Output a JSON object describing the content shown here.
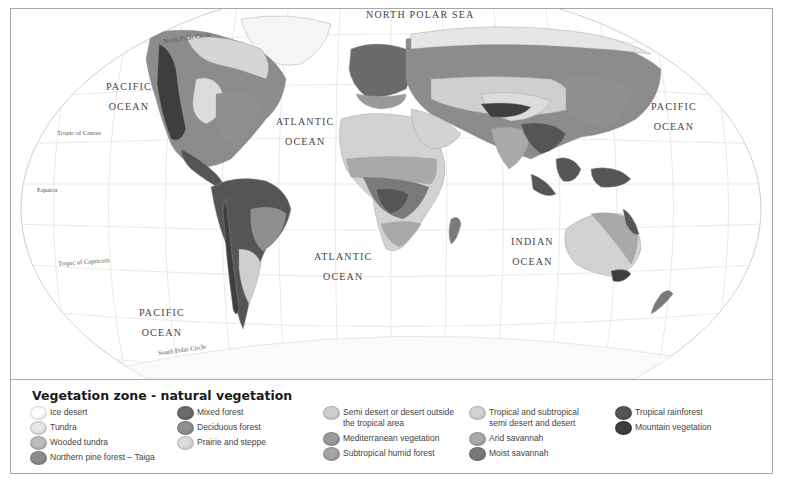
{
  "map": {
    "title": "Vegetation zone - natural vegetation",
    "oceans": [
      {
        "id": "north-polar-sea",
        "line1": "NORTH POLAR SEA",
        "line2": ""
      },
      {
        "id": "pacific-ocean-nw",
        "line1": "PACIFIC",
        "line2": "OCEAN"
      },
      {
        "id": "atlantic-ocean-north",
        "line1": "ATLANTIC",
        "line2": "OCEAN"
      },
      {
        "id": "pacific-ocean-ne",
        "line1": "PACIFIC",
        "line2": "OCEAN"
      },
      {
        "id": "atlantic-ocean-south",
        "line1": "ATLANTIC",
        "line2": "OCEAN"
      },
      {
        "id": "indian-ocean",
        "line1": "INDIAN",
        "line2": "OCEAN"
      },
      {
        "id": "pacific-ocean-sw",
        "line1": "PACIFIC",
        "line2": "OCEAN"
      }
    ],
    "lines": {
      "north_polar_circle": "North Polar Circle",
      "tropic_of_cancer": "Tropic of Cancer",
      "equator": "Equator",
      "tropic_of_capricorn": "Tropic of Capricorn",
      "south_polar_circle": "South Polar Circle"
    }
  },
  "legend": {
    "title": "Vegetation zone - natural vegetation",
    "columns": [
      [
        {
          "label": "Ice desert",
          "color": "#ffffff"
        },
        {
          "label": "Tundra",
          "color": "#e6e6e6"
        },
        {
          "label": "Wooded tundra",
          "color": "#bdbdbd"
        },
        {
          "label": "Northern pine forest – Taiga",
          "color": "#8c8c8c"
        }
      ],
      [
        {
          "label": "Mixed forest",
          "color": "#6a6a6a"
        },
        {
          "label": "Deciduous forest",
          "color": "#8f8f8f"
        },
        {
          "label": "Prairie and steppe",
          "color": "#dcdcdc"
        }
      ],
      [
        {
          "label": "Semi desert or desert outside the tropical area",
          "color": "#cfcfcf"
        },
        {
          "label": "Mediterranean vegetation",
          "color": "#9a9a9a"
        },
        {
          "label": "Subtropical humid forest",
          "color": "#a4a4a4"
        }
      ],
      [
        {
          "label": "Tropical and subtropical semi desert and desert",
          "color": "#d2d2d2"
        },
        {
          "label": "Arid savannah",
          "color": "#a9a9a9"
        },
        {
          "label": "Moist savannah",
          "color": "#7a7a7a"
        }
      ],
      [
        {
          "label": "Tropical rainforest",
          "color": "#555555"
        },
        {
          "label": "Mountain vegetation",
          "color": "#3e3e3e"
        }
      ]
    ]
  },
  "colors": {
    "frame_border": "#a8a8a8",
    "graticule": "#dadada",
    "ocean": "#ffffff",
    "text": "#444444"
  }
}
